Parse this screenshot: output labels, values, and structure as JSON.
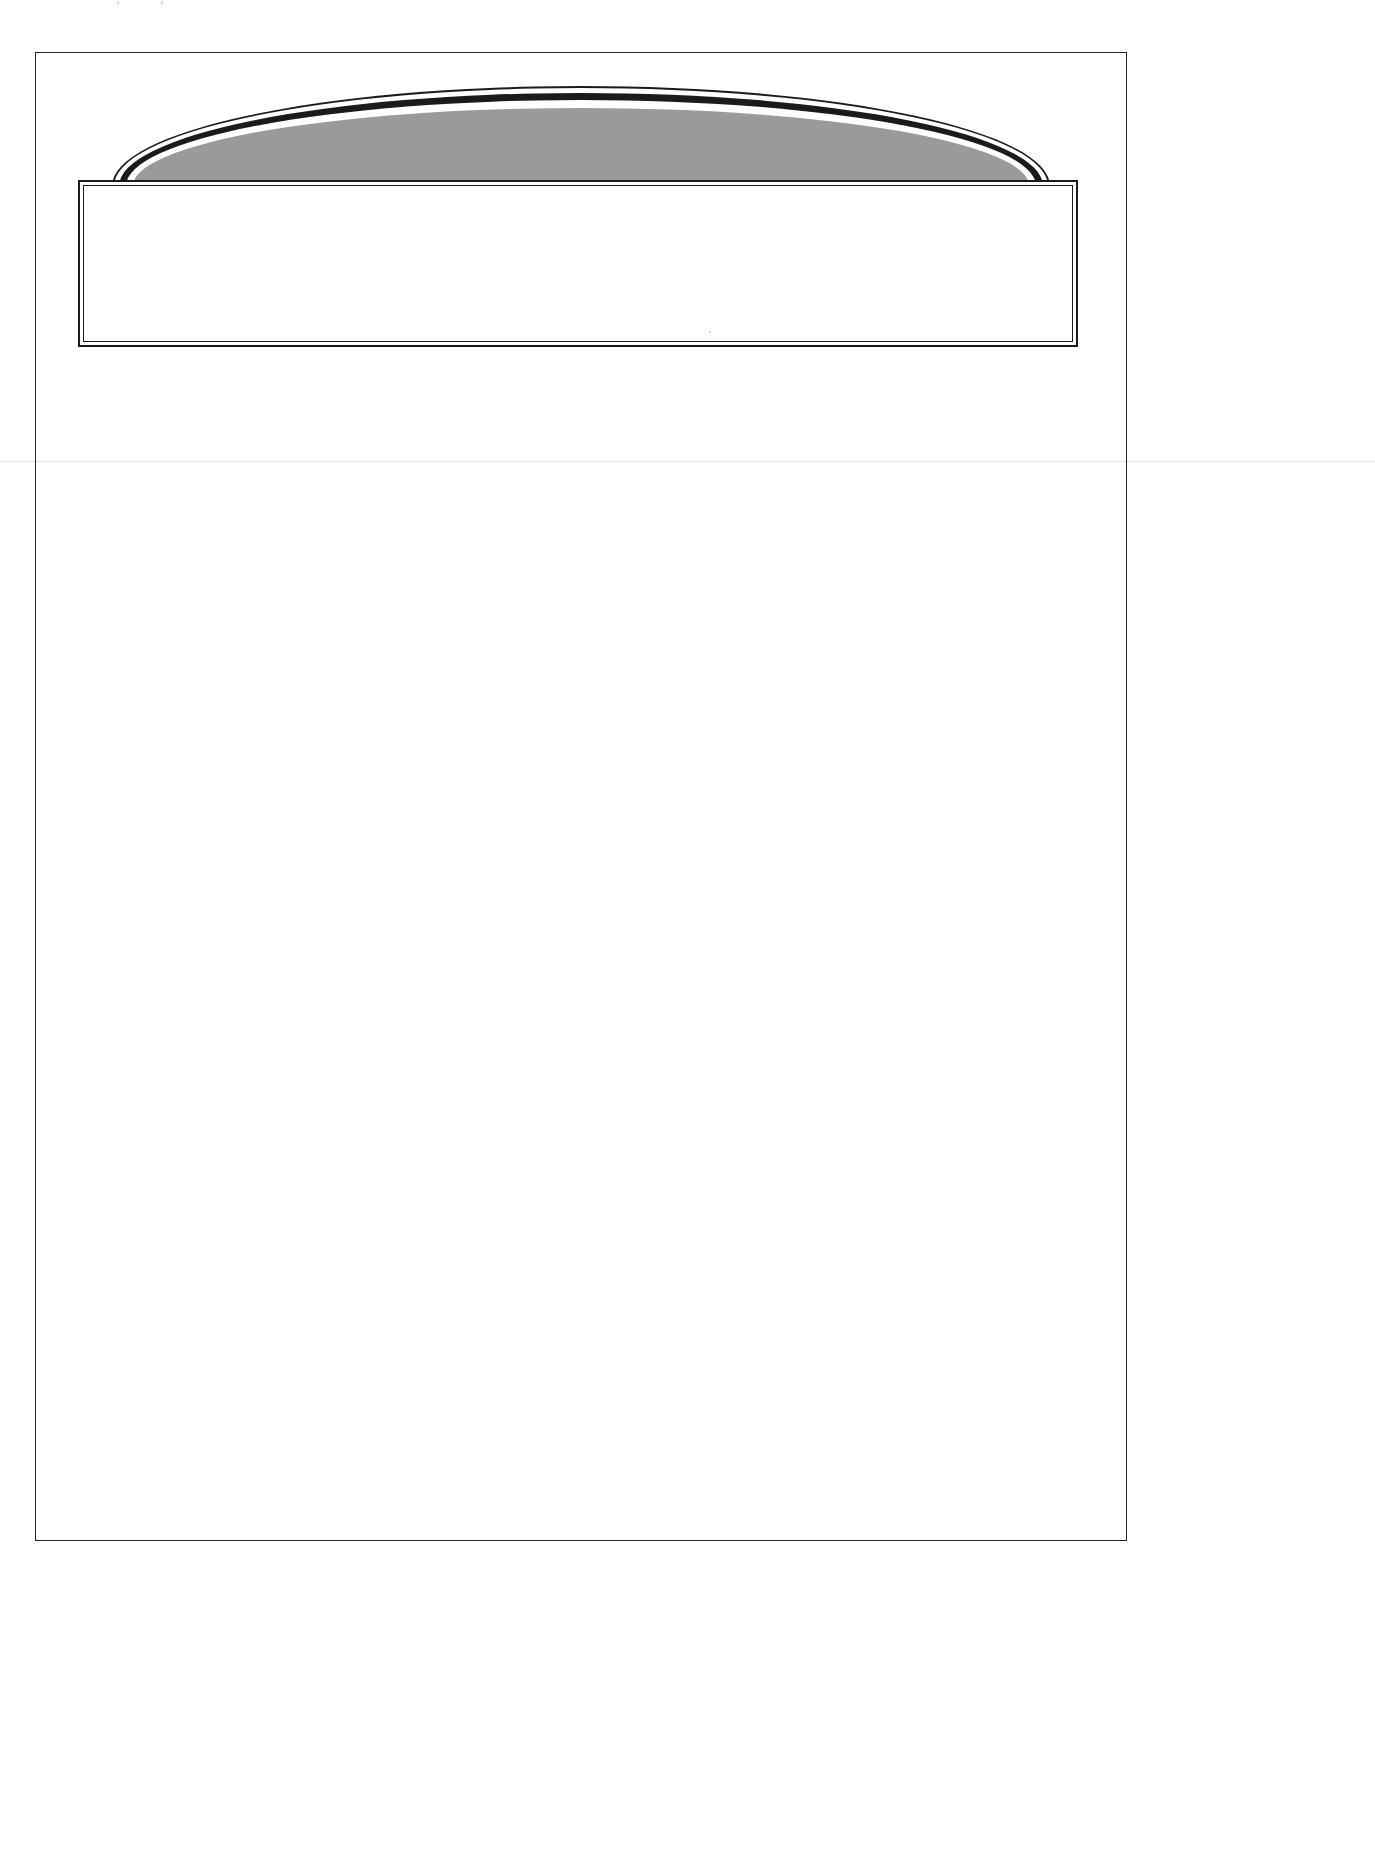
{
  "document": {
    "kind": "scanned-drawing-sheet",
    "header_text": "·  ·····  ,  ····  ,  ···  ··",
    "caption_text": ""
  },
  "figure": {
    "name": "arched-cap-figure",
    "fill_label": "",
    "colors": {
      "stroke": "#1b1b1b",
      "halftone_fill": "#9a9a9a",
      "paper": "#ffffff",
      "frame": "#242424",
      "seam": "#e3e3e8"
    }
  },
  "caption_box": {
    "label": ""
  },
  "drawing_area": {
    "label": ""
  }
}
